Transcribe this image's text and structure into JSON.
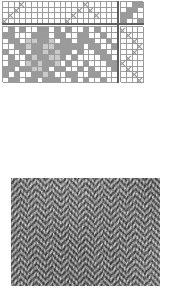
{
  "document": {
    "title": "Weaving draft with woven fabric sample",
    "kind": "weaving-draft",
    "description": "Four-shaft point twill weaving draft: threading, tie-up, treadling and drawdown, above a photograph of the resulting herringbone twill fabric."
  },
  "colors": {
    "background": "#ffffff",
    "grid_line": "#9b9b9b",
    "heavy_line": "#5d5d5d",
    "mark": "#8e8e8e",
    "fill_dark": "#9a9a9a",
    "fill_light": "#c9c9c9",
    "fabric_dark": "#4a4a4a",
    "fabric_light": "#cfcfcf"
  },
  "draft": {
    "threading": {
      "label": "threading",
      "shafts": 4,
      "ends": 20,
      "mark": "x",
      "rows": [
        [
          0,
          0,
          0,
          1,
          0,
          0,
          0,
          0,
          0,
          0,
          0,
          0,
          0,
          0,
          1,
          0,
          0,
          0,
          0,
          0
        ],
        [
          0,
          0,
          1,
          0,
          0,
          0,
          0,
          0,
          0,
          0,
          0,
          0,
          0,
          1,
          0,
          1,
          0,
          0,
          0,
          0
        ],
        [
          0,
          1,
          0,
          0,
          0,
          0,
          0,
          0,
          0,
          0,
          0,
          0,
          1,
          0,
          0,
          0,
          1,
          0,
          0,
          0
        ],
        [
          1,
          0,
          0,
          0,
          0,
          0,
          0,
          0,
          0,
          0,
          0,
          1,
          0,
          0,
          0,
          0,
          0,
          0,
          0,
          0
        ]
      ]
    },
    "tieup": {
      "label": "tie-up",
      "shafts": 4,
      "treadles": 4,
      "rows": [
        [
          0,
          0,
          1,
          1
        ],
        [
          0,
          1,
          1,
          0
        ],
        [
          1,
          1,
          0,
          0
        ],
        [
          1,
          0,
          0,
          1
        ]
      ]
    },
    "treadling": {
      "label": "treadling",
      "treadles": 4,
      "picks": 10,
      "mark": "x",
      "rows": [
        [
          1,
          0,
          0,
          0
        ],
        [
          0,
          1,
          0,
          0
        ],
        [
          0,
          0,
          1,
          0
        ],
        [
          0,
          0,
          0,
          1
        ],
        [
          0,
          0,
          1,
          0
        ],
        [
          0,
          1,
          0,
          0
        ],
        [
          1,
          0,
          0,
          0
        ],
        [
          0,
          1,
          0,
          0
        ],
        [
          0,
          0,
          1,
          0
        ],
        [
          0,
          0,
          0,
          1
        ]
      ]
    },
    "drawdown": {
      "label": "drawdown",
      "columns": 20,
      "rows_count": 10,
      "legend": {
        "0": "warp (white)",
        "1": "medium grey",
        "2": "light grey"
      },
      "rows": [
        [
          0,
          1,
          0,
          1,
          0,
          0,
          1,
          1,
          0,
          1,
          0,
          1,
          0,
          0,
          1,
          0,
          1,
          0,
          0,
          0
        ],
        [
          1,
          1,
          0,
          0,
          0,
          1,
          1,
          1,
          0,
          1,
          1,
          0,
          0,
          1,
          1,
          0,
          0,
          1,
          0,
          0
        ],
        [
          0,
          1,
          1,
          0,
          2,
          2,
          1,
          1,
          2,
          0,
          1,
          1,
          0,
          1,
          1,
          1,
          0,
          0,
          1,
          0
        ],
        [
          0,
          0,
          1,
          1,
          2,
          1,
          1,
          2,
          2,
          1,
          1,
          1,
          1,
          1,
          0,
          1,
          1,
          0,
          0,
          1
        ],
        [
          1,
          0,
          0,
          1,
          0,
          1,
          1,
          2,
          1,
          2,
          1,
          1,
          0,
          1,
          0,
          0,
          1,
          1,
          0,
          0
        ],
        [
          0,
          1,
          0,
          0,
          1,
          2,
          1,
          1,
          2,
          2,
          1,
          0,
          1,
          0,
          0,
          0,
          0,
          1,
          1,
          0
        ],
        [
          0,
          1,
          1,
          0,
          2,
          1,
          2,
          1,
          1,
          2,
          0,
          1,
          0,
          0,
          1,
          0,
          0,
          0,
          1,
          1
        ],
        [
          1,
          1,
          0,
          1,
          1,
          2,
          2,
          1,
          0,
          1,
          1,
          0,
          0,
          1,
          0,
          1,
          0,
          0,
          0,
          1
        ],
        [
          1,
          0,
          1,
          0,
          0,
          1,
          1,
          2,
          1,
          0,
          0,
          1,
          1,
          0,
          0,
          1,
          1,
          0,
          0,
          0
        ],
        [
          0,
          1,
          1,
          0,
          1,
          1,
          0,
          1,
          1,
          1,
          0,
          0,
          1,
          0,
          1,
          0,
          0,
          1,
          0,
          0
        ]
      ]
    }
  },
  "fabric_photo": {
    "label": "woven fabric sample",
    "weave": "herringbone twill",
    "zigzag_columns": 9,
    "tone": "grey wool"
  }
}
